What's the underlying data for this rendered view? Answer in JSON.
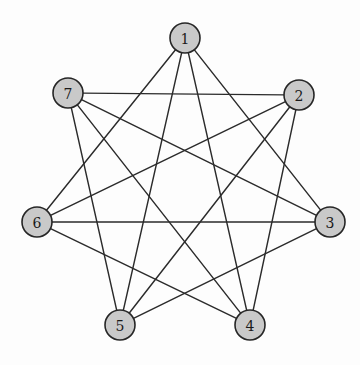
{
  "figure": {
    "name": "circulant-graph-c7-2-3",
    "background_color": "#fdfdfd",
    "width": 360,
    "height": 365
  },
  "style": {
    "node_fill": "#c9c9c9",
    "node_stroke": "#262626",
    "node_radius": 15,
    "node_stroke_width": 1.6,
    "edge_color": "#2b2b2b",
    "edge_width": 1.45,
    "label_color": "#1a1a1a",
    "label_font_size": 14
  },
  "chart_data": {
    "type": "diagram",
    "subtype": "undirected-graph",
    "title": "",
    "layout": "circular",
    "center": {
      "x": 183,
      "y": 208
    },
    "radius": 147,
    "node_count": 7,
    "edge_count": 14,
    "degree_sequence": [
      4,
      4,
      4,
      4,
      4,
      4,
      4
    ],
    "connection_rule": "each vertex joins the vertices 2 and 3 positions away around the circle",
    "nodes": [
      {
        "id": "1",
        "label": "1",
        "x": 185,
        "y": 38
      },
      {
        "id": "2",
        "label": "2",
        "x": 299,
        "y": 95
      },
      {
        "id": "3",
        "label": "3",
        "x": 330,
        "y": 222
      },
      {
        "id": "4",
        "label": "4",
        "x": 250,
        "y": 325
      },
      {
        "id": "5",
        "label": "5",
        "x": 120,
        "y": 325
      },
      {
        "id": "6",
        "label": "6",
        "x": 37,
        "y": 222
      },
      {
        "id": "7",
        "label": "7",
        "x": 68,
        "y": 93
      }
    ],
    "edges": [
      {
        "from": "1",
        "to": "3"
      },
      {
        "from": "1",
        "to": "4"
      },
      {
        "from": "1",
        "to": "5"
      },
      {
        "from": "1",
        "to": "6"
      },
      {
        "from": "2",
        "to": "4"
      },
      {
        "from": "2",
        "to": "5"
      },
      {
        "from": "2",
        "to": "6"
      },
      {
        "from": "2",
        "to": "7"
      },
      {
        "from": "3",
        "to": "5"
      },
      {
        "from": "3",
        "to": "6"
      },
      {
        "from": "3",
        "to": "7"
      },
      {
        "from": "4",
        "to": "6"
      },
      {
        "from": "4",
        "to": "7"
      },
      {
        "from": "5",
        "to": "7"
      }
    ]
  }
}
